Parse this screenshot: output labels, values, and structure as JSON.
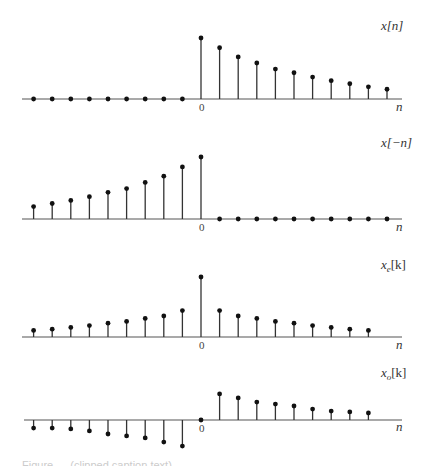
{
  "chart_data": [
    {
      "type": "stem",
      "title": "x[n]",
      "xlabel": "n",
      "zero_tick": "0",
      "n": [
        -9,
        -8,
        -7,
        -6,
        -5,
        -4,
        -3,
        -2,
        -1,
        0,
        1,
        2,
        3,
        4,
        5,
        6,
        7,
        8,
        9,
        10
      ],
      "values": [
        0,
        0,
        0,
        0,
        0,
        0,
        0,
        0,
        0,
        1.0,
        0.84,
        0.69,
        0.59,
        0.49,
        0.43,
        0.36,
        0.3,
        0.25,
        0.2,
        0.16
      ],
      "layout": {
        "axis_y": 99,
        "x0": 201,
        "dx": 18.6,
        "scale": 61,
        "axis_x1": 22,
        "axis_x2": 402,
        "label_x": 381,
        "label_y": 30,
        "n_label_y": 111
      }
    },
    {
      "type": "stem",
      "title": "x[−n]",
      "xlabel": "n",
      "zero_tick": "0",
      "n": [
        -9,
        -8,
        -7,
        -6,
        -5,
        -4,
        -3,
        -2,
        -1,
        0,
        1,
        2,
        3,
        4,
        5,
        6,
        7,
        8,
        9,
        10
      ],
      "values": [
        0.2,
        0.25,
        0.3,
        0.36,
        0.43,
        0.49,
        0.59,
        0.69,
        0.84,
        1.0,
        0,
        0,
        0,
        0,
        0,
        0,
        0,
        0,
        0,
        0
      ],
      "layout": {
        "axis_y": 219,
        "x0": 201,
        "dx": 18.6,
        "scale": 62,
        "axis_x1": 22,
        "axis_x2": 402,
        "label_x": 381,
        "label_y": 147,
        "n_label_y": 231
      }
    },
    {
      "type": "stem",
      "title": "x_e[k]",
      "xlabel": "n",
      "zero_tick": "0",
      "n": [
        -9,
        -8,
        -7,
        -6,
        -5,
        -4,
        -3,
        -2,
        -1,
        0,
        1,
        2,
        3,
        4,
        5,
        6,
        7,
        8,
        9
      ],
      "values": [
        0.11,
        0.13,
        0.16,
        0.19,
        0.23,
        0.26,
        0.31,
        0.35,
        0.44,
        1.0,
        0.44,
        0.35,
        0.31,
        0.26,
        0.23,
        0.19,
        0.16,
        0.13,
        0.11
      ],
      "layout": {
        "axis_y": 337,
        "x0": 201,
        "dx": 18.6,
        "scale": 60,
        "axis_x1": 22,
        "axis_x2": 402,
        "label_x": 381,
        "label_y": 269,
        "n_label_y": 349
      }
    },
    {
      "type": "stem",
      "title": "x_o[k]",
      "xlabel": "n",
      "zero_tick": "0",
      "n": [
        -9,
        -8,
        -7,
        -6,
        -5,
        -4,
        -3,
        -2,
        -1,
        0,
        1,
        2,
        3,
        4,
        5,
        6,
        7,
        8,
        9
      ],
      "values": [
        -0.29,
        -0.29,
        -0.32,
        -0.39,
        -0.5,
        -0.57,
        -0.64,
        -0.79,
        -0.93,
        0,
        0.93,
        0.79,
        0.64,
        0.57,
        0.5,
        0.39,
        0.32,
        0.29,
        0.25
      ],
      "layout": {
        "axis_y": 420,
        "x0": 201,
        "dx": 18.6,
        "scale": 28,
        "axis_x1": 24,
        "axis_x2": 402,
        "label_x": 381,
        "label_y": 377,
        "n_label_y": 431
      }
    }
  ],
  "labels": {
    "plot1": {
      "signal": "x[n]",
      "axis": "n",
      "zero": "0"
    },
    "plot2": {
      "signal": "x[−n]",
      "axis": "n",
      "zero": "0"
    },
    "plot3": {
      "signal_base": "x",
      "signal_sub": "e",
      "signal_arg": "[k]",
      "axis": "n",
      "zero": "0"
    },
    "plot4": {
      "signal_base": "x",
      "signal_sub": "o",
      "signal_arg": "[k]",
      "axis": "n",
      "zero": "0"
    }
  },
  "caption": "Figure — (clipped caption text)"
}
